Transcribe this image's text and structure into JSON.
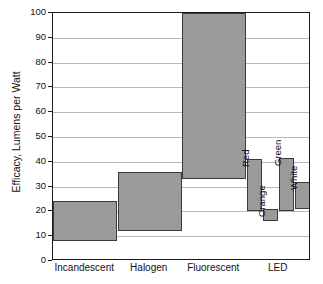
{
  "chart_data": {
    "type": "bar",
    "bar_style": "floating-range",
    "title": "",
    "subtitle": "",
    "xlabel": "",
    "ylabel": "Efficacy, Lumens per Watt",
    "ylim": [
      0,
      100
    ],
    "ytick_step": 10,
    "yticks": [
      0,
      10,
      20,
      30,
      40,
      50,
      60,
      70,
      80,
      90,
      100
    ],
    "ytick_labels": [
      "0",
      "10",
      "20",
      "30",
      "40",
      "50",
      "60",
      "70",
      "80",
      "90",
      "100"
    ],
    "grid": true,
    "grid_axis": "y",
    "legend": false,
    "legend_position": "none",
    "categories": [
      "Incandescent",
      "Halogen",
      "Fluorescent",
      "LED"
    ],
    "bars": [
      {
        "category": "Incandescent",
        "label": "",
        "low": 8,
        "high": 24
      },
      {
        "category": "Halogen",
        "label": "",
        "low": 12,
        "high": 36
      },
      {
        "category": "Fluorescent",
        "label": "",
        "low": 33,
        "high": 100
      },
      {
        "category": "LED",
        "label": "Red",
        "low": 20,
        "high": 41
      },
      {
        "category": "LED",
        "label": "Orange",
        "low": 16,
        "high": 21
      },
      {
        "category": "LED",
        "label": "Green",
        "low": 20,
        "high": 41.5
      },
      {
        "category": "LED",
        "label": "White",
        "low": 21,
        "high": 32
      }
    ],
    "series_labels": [
      "Red",
      "Orange",
      "Green",
      "White"
    ],
    "colors": {
      "bar_fill": "#9a9a9a",
      "bar_border": "#3a3a3a",
      "grid": "#b9b9b9",
      "axis": "#1b1b1b",
      "text": "#111111",
      "background": "#ffffff"
    }
  }
}
